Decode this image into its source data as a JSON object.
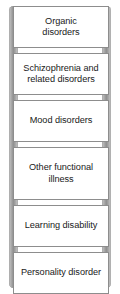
{
  "diagram": {
    "type": "ladder",
    "title": "",
    "colors": {
      "rail": "#8f8f8f",
      "rung_border": "#8d8d8d",
      "rung_fill": "#ffffff",
      "text": "#1a1a1a",
      "background": "#ffffff"
    },
    "rails": [
      {
        "name": "left-rail"
      },
      {
        "name": "right-rail"
      }
    ],
    "rungs": [
      {
        "id": "organic",
        "label": "Organic\ndisorders",
        "line1": "Organic",
        "line2": "disorders",
        "lines": 2
      },
      {
        "id": "schizophrenia",
        "label": "Schizophrenia and related disorders",
        "line1": "Schizophrenia and",
        "line2": "related disorders",
        "lines": 2
      },
      {
        "id": "mood",
        "label": "Mood disorders",
        "line1": "Mood",
        "line2": "disorders",
        "lines": 2
      },
      {
        "id": "other-functional",
        "label": "Other functional illness",
        "line1": "Other",
        "line2": "functional",
        "line3": "illness",
        "lines": 3
      },
      {
        "id": "learning",
        "label": "Learning disability",
        "line1": "Learning",
        "line2": "disability",
        "lines": 2
      },
      {
        "id": "personality",
        "label": "Personality disorder",
        "line1": "Personality",
        "line2": "disorder",
        "lines": 2
      }
    ]
  }
}
